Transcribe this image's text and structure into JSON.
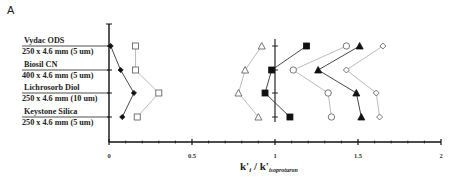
{
  "panel_label": "A",
  "chart_data": {
    "type": "scatter",
    "title": "",
    "xlabel": "k'i / k'isoproturon",
    "xlabel_main": "k'",
    "xlabel_i": "i",
    "xlabel_sep": " / k'",
    "xlabel_sub": "isoproturon",
    "ylabel": "",
    "xlim": [
      0,
      2
    ],
    "x_ticks": [
      "0",
      "0.5",
      "1",
      "1.5",
      "2"
    ],
    "grid": false,
    "legend": "none",
    "categories": [
      {
        "name": "Vydac ODS",
        "dims": "250 x 4.6 mm (5 um)"
      },
      {
        "name": "Biosil CN",
        "dims": "400 x 4.6 mm (5 um)"
      },
      {
        "name": "Lichrosorb Diol",
        "dims": "250 x 4.6 mm (10 um)"
      },
      {
        "name": "Keystone Silica",
        "dims": "250 x 4.6 mm (5 um)"
      }
    ],
    "series": [
      {
        "name": "filled-diamond",
        "marker": "diamond",
        "filled": true,
        "values": [
          0.01,
          0.07,
          0.15,
          0.08
        ]
      },
      {
        "name": "open-square",
        "marker": "square",
        "filled": false,
        "values": [
          0.16,
          0.16,
          0.3,
          0.17
        ]
      },
      {
        "name": "open-triangle",
        "marker": "triangle",
        "filled": false,
        "values": [
          0.92,
          0.82,
          0.78,
          0.9
        ]
      },
      {
        "name": "filled-square",
        "marker": "square",
        "filled": true,
        "values": [
          1.19,
          0.98,
          0.94,
          1.09
        ]
      },
      {
        "name": "open-circle",
        "marker": "circle",
        "filled": false,
        "values": [
          1.43,
          1.11,
          1.32,
          1.34
        ]
      },
      {
        "name": "filled-triangle",
        "marker": "triangle",
        "filled": true,
        "values": [
          1.51,
          1.26,
          1.49,
          1.52
        ]
      },
      {
        "name": "open-diamond",
        "marker": "diamond",
        "filled": false,
        "values": [
          1.65,
          1.43,
          1.61,
          1.63
        ]
      }
    ]
  }
}
